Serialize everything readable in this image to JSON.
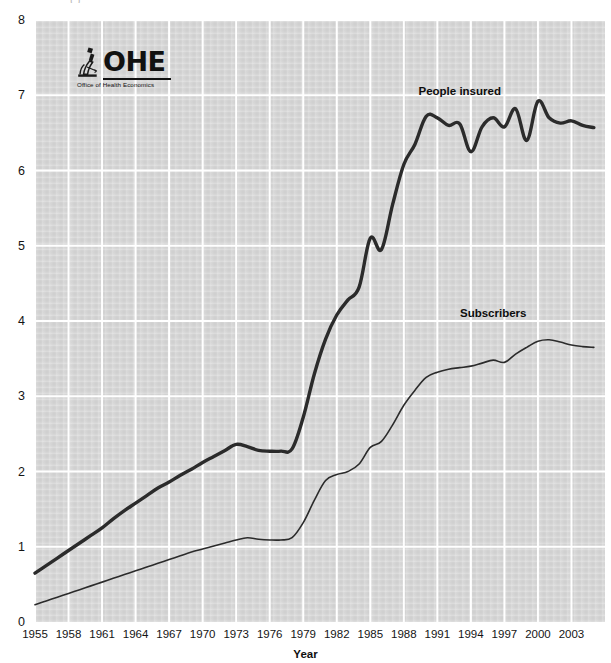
{
  "chart_data": {
    "type": "line",
    "title": "",
    "xlabel": "Year",
    "ylabel": "",
    "xlim": [
      1955,
      2006
    ],
    "ylim": [
      0,
      8
    ],
    "grid": true,
    "grid_color": "#ffffff",
    "plot_background": "#d6d6d6",
    "legend_position": "inline-annotations",
    "x_tick_labels": [
      "1955",
      "1958",
      "1961",
      "1964",
      "1967",
      "1970",
      "1973",
      "1976",
      "1979",
      "1982",
      "1985",
      "1988",
      "1991",
      "1994",
      "1997",
      "2000",
      "2003"
    ],
    "y_tick_labels": [
      "0",
      "1",
      "2",
      "3",
      "4",
      "5",
      "6",
      "7",
      "8"
    ],
    "x_tick_values": [
      1955,
      1958,
      1961,
      1964,
      1967,
      1970,
      1973,
      1976,
      1979,
      1982,
      1985,
      1988,
      1991,
      1994,
      1997,
      2000,
      2003
    ],
    "y_tick_values": [
      0,
      1,
      2,
      3,
      4,
      5,
      6,
      7,
      8
    ],
    "x": [
      1955,
      1956,
      1957,
      1958,
      1959,
      1960,
      1961,
      1962,
      1963,
      1964,
      1965,
      1966,
      1967,
      1968,
      1969,
      1970,
      1971,
      1972,
      1973,
      1974,
      1975,
      1976,
      1977,
      1978,
      1979,
      1980,
      1981,
      1982,
      1983,
      1984,
      1985,
      1986,
      1987,
      1988,
      1989,
      1990,
      1991,
      1992,
      1993,
      1994,
      1995,
      1996,
      1997,
      1998,
      1999,
      2000,
      2001,
      2002,
      2003,
      2004,
      2005
    ],
    "series": [
      {
        "name": "People insured",
        "color": "#2b2b2b",
        "line_width": 3.4,
        "label_x": 1993,
        "label_y": 7.05,
        "values": [
          0.65,
          0.75,
          0.85,
          0.95,
          1.05,
          1.15,
          1.25,
          1.37,
          1.48,
          1.58,
          1.68,
          1.78,
          1.86,
          1.95,
          2.03,
          2.12,
          2.2,
          2.28,
          2.36,
          2.33,
          2.28,
          2.27,
          2.27,
          2.3,
          2.72,
          3.3,
          3.76,
          4.08,
          4.28,
          4.45,
          5.1,
          4.95,
          5.55,
          6.08,
          6.35,
          6.72,
          6.7,
          6.6,
          6.62,
          6.25,
          6.58,
          6.7,
          6.58,
          6.82,
          6.4,
          6.92,
          6.7,
          6.63,
          6.66,
          6.6,
          6.57
        ]
      },
      {
        "name": "Subscribers",
        "color": "#2b2b2b",
        "line_width": 1.6,
        "label_x": 1996,
        "label_y": 4.1,
        "values": [
          0.23,
          0.28,
          0.33,
          0.38,
          0.43,
          0.48,
          0.53,
          0.58,
          0.63,
          0.68,
          0.73,
          0.78,
          0.83,
          0.88,
          0.93,
          0.97,
          1.01,
          1.05,
          1.09,
          1.12,
          1.1,
          1.09,
          1.09,
          1.12,
          1.32,
          1.62,
          1.88,
          1.96,
          2.0,
          2.1,
          2.32,
          2.4,
          2.62,
          2.88,
          3.08,
          3.25,
          3.32,
          3.36,
          3.38,
          3.4,
          3.44,
          3.48,
          3.45,
          3.56,
          3.65,
          3.73,
          3.75,
          3.72,
          3.68,
          3.66,
          3.65
        ]
      }
    ]
  },
  "annotations": {
    "people_insured_label": "People insured",
    "subscribers_label": "Subscribers"
  },
  "logo": {
    "wordmark": "OHE",
    "subtitle": "Office of Health Economics",
    "icon": "microscope-icon"
  },
  "top_clipped_text": "(   )"
}
